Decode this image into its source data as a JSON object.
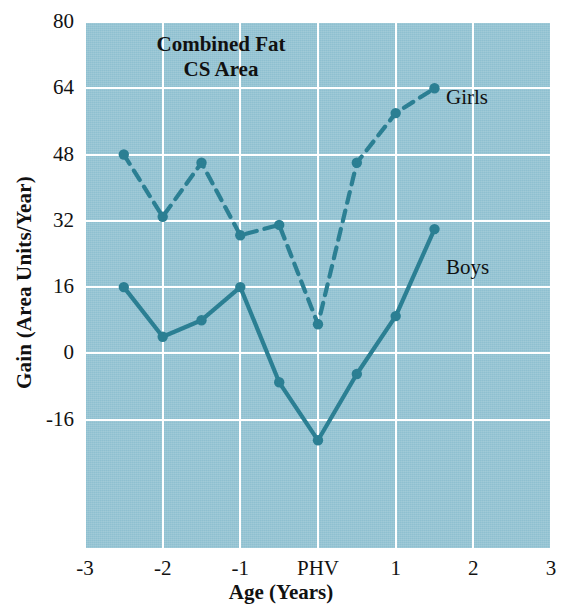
{
  "chart_data": {
    "type": "line",
    "title": "Combined Fat CS Area",
    "title_line1": "Combined Fat",
    "title_line2": "CS Area",
    "xlabel": "Age (Years)",
    "ylabel": "Gain (Area Units/Year)",
    "xlim": [
      -3,
      3
    ],
    "ylim": [
      -47,
      80
    ],
    "grid": true,
    "legend_position": "inline-right-of-series",
    "xticks": [
      -3,
      -2,
      -1,
      0,
      1,
      2,
      3
    ],
    "xticklabels": [
      "-3",
      "-2",
      "-1",
      "PHV",
      "1",
      "2",
      "3"
    ],
    "yticks": [
      -16,
      0,
      16,
      32,
      48,
      64,
      80
    ],
    "yticklabels": [
      "-16",
      "0",
      "16",
      "32",
      "48",
      "64",
      "80"
    ],
    "series": [
      {
        "name": "Girls",
        "linestyle": "dashed",
        "color": "#2b7f93",
        "x": [
          -2.5,
          -2.0,
          -1.5,
          -1.0,
          -0.5,
          0.0,
          0.5,
          1.0,
          1.5
        ],
        "values": [
          48,
          33,
          46,
          28.5,
          31,
          7,
          46,
          58,
          64
        ]
      },
      {
        "name": "Boys",
        "linestyle": "solid",
        "color": "#2b7f93",
        "x": [
          -2.5,
          -2.0,
          -1.5,
          -1.0,
          -0.5,
          0.0,
          0.5,
          1.0,
          1.5
        ],
        "values": [
          16,
          4,
          8,
          16,
          -7,
          -21,
          -5,
          9,
          30
        ]
      }
    ]
  },
  "colors": {
    "plot_background": "#8ec0d0",
    "gridline": "#ffffff",
    "series": "#2b7f93",
    "text": "#111111",
    "page_background": "#ffffff"
  },
  "labels": {
    "girls": "Girls",
    "boys": "Boys"
  }
}
